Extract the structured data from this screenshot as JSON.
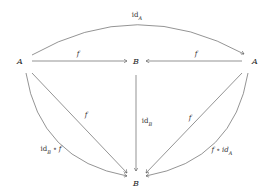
{
  "objects": {
    "a_left": "A",
    "b_top": "B",
    "a_right": "A",
    "b_bottom": "B"
  },
  "arrows": {
    "top_arc": {
      "name": "id",
      "sub": "A"
    },
    "a_left_to_b": {
      "label": "f"
    },
    "a_right_to_b": {
      "label": "f"
    },
    "b_to_b": {
      "name": "id",
      "sub": "B"
    },
    "a_left_diag": {
      "label": "f"
    },
    "a_right_diag": {
      "label": "f"
    },
    "left_curve": {
      "prefix": "id",
      "sub": "B",
      "suffix": " ∘ f"
    },
    "right_curve": {
      "prefix": "f ∘ id",
      "sub": "A"
    }
  },
  "colors": {
    "stroke": "#555555"
  }
}
